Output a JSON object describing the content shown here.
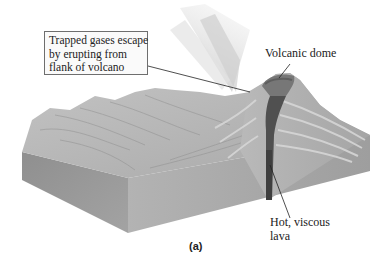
{
  "figure": {
    "caption": "(a)",
    "labels": {
      "trapped_gases": [
        "Trapped gases escape",
        "by erupting from",
        "flank of volcano"
      ],
      "volcanic_dome": "Volcanic dome",
      "hot_viscous_lava": [
        "Hot, viscous",
        "lava"
      ]
    },
    "colors": {
      "block_front": "#a9a9a9",
      "block_side": "#9a9a9a",
      "terrain": "#b8b8b8",
      "conduit": "#4a4a4a",
      "dome": "#6f6f6f",
      "gas_plume": "#d9d9d9",
      "leader_line": "#222222"
    }
  }
}
